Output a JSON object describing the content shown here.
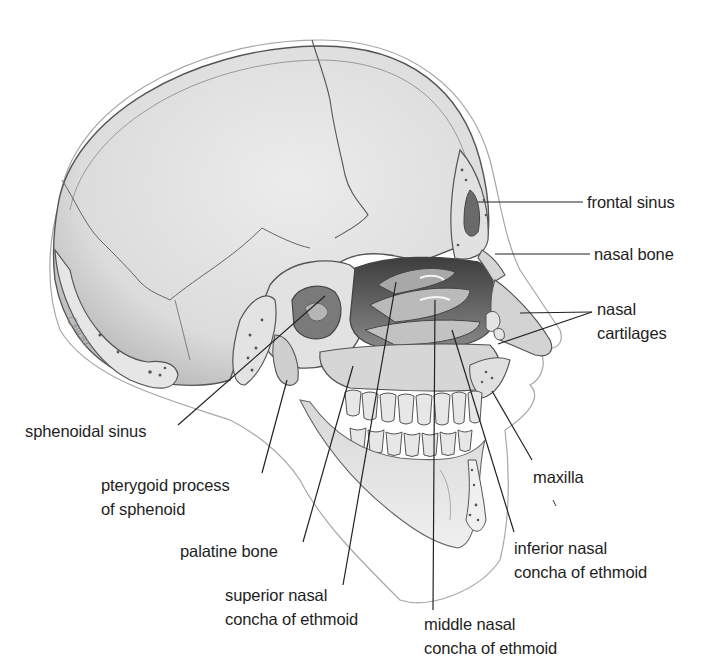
{
  "diagram": {
    "labels": [
      {
        "id": "frontal-sinus",
        "lines": [
          "frontal sinus"
        ],
        "x": 587,
        "y": 193
      },
      {
        "id": "nasal-bone",
        "lines": [
          "nasal bone"
        ],
        "x": 594,
        "y": 243
      },
      {
        "id": "nasal-cartilages",
        "lines": [
          "nasal",
          "cartilages"
        ],
        "x": 596,
        "y": 299
      },
      {
        "id": "sphenoidal-sinus",
        "lines": [
          "sphenoidal sinus"
        ],
        "x": 25,
        "y": 420
      },
      {
        "id": "pterygoid-process",
        "lines": [
          "pterygoid process",
          "of sphenoid"
        ],
        "x": 101,
        "y": 474
      },
      {
        "id": "maxilla",
        "lines": [
          "maxilla"
        ],
        "x": 533,
        "y": 466
      },
      {
        "id": "palatine-bone",
        "lines": [
          "palatine bone"
        ],
        "x": 180,
        "y": 540
      },
      {
        "id": "inferior-nasal-concha",
        "lines": [
          "inferior nasal",
          "concha of ethmoid"
        ],
        "x": 514,
        "y": 537
      },
      {
        "id": "superior-nasal-concha",
        "lines": [
          "superior nasal",
          "concha of ethmoid"
        ],
        "x": 225,
        "y": 583
      },
      {
        "id": "middle-nasal-concha",
        "lines": [
          "middle nasal",
          "concha of ethmoid"
        ],
        "x": 424,
        "y": 614
      }
    ],
    "colors": {
      "bone": "#e4e4e4",
      "bone_shade": "#c9c9c9",
      "cavity": "#5a5a5a",
      "outline": "#555555",
      "leader": "#222222",
      "text": "#1e1e1e"
    }
  }
}
